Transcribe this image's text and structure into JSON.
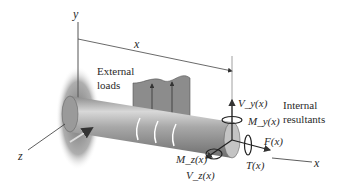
{
  "diagram": {
    "axes": {
      "y_label": "y",
      "z_label": "z",
      "x_label": "x",
      "dimension_label": "x"
    },
    "annotations": {
      "external_line1": "External",
      "external_line2": "loads",
      "internal_line1": "Internal",
      "internal_line2": "resultants"
    },
    "resultants": {
      "vy": "V_y(x)",
      "my": "M_y(x)",
      "fx": "F(x)",
      "tx": "T(x)",
      "mz": "M_z(x)",
      "vz": "V_z(x)"
    },
    "colors": {
      "shaft": "#9a9a9a",
      "shaft_highlight": "#d9d9d9",
      "load_fill": "#8c8c8c",
      "wall_shadow": "#7a7a7a",
      "line": "#333333"
    }
  }
}
